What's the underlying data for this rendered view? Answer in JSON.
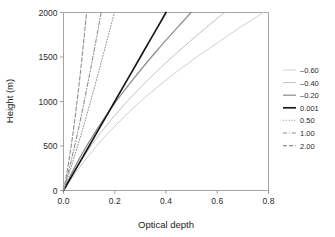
{
  "chart_data": {
    "type": "line",
    "title": "",
    "xlabel": "Optical depth",
    "ylabel": "Height (m)",
    "xlim": [
      0.0,
      0.8
    ],
    "ylim": [
      0,
      2000
    ],
    "xticks": [
      "0.0",
      "0.2",
      "0.4",
      "0.6",
      "0.8"
    ],
    "xtick_values": [
      0.0,
      0.2,
      0.4,
      0.6,
      0.8
    ],
    "yticks": [
      "0",
      "500",
      "1000",
      "1500",
      "2000"
    ],
    "ytick_values": [
      0,
      500,
      1000,
      1500,
      2000
    ],
    "grid": false,
    "legend_position": "right-outside",
    "legend_title": "",
    "series": [
      {
        "name": "-0.60",
        "label": "–0.60",
        "color": "#d0d0d0",
        "style": "solid",
        "width": 1.0,
        "x": [
          0.0,
          0.039,
          0.082,
          0.129,
          0.181,
          0.238,
          0.3,
          0.368,
          0.441,
          0.52,
          0.604,
          0.689,
          0.78
        ],
        "y": [
          0,
          167,
          333,
          500,
          667,
          833,
          1000,
          1167,
          1333,
          1500,
          1667,
          1833,
          2000
        ]
      },
      {
        "name": "-0.40",
        "label": "–0.40",
        "color": "#c2c2c2",
        "style": "solid",
        "width": 1.0,
        "x": [
          0.0,
          0.032,
          0.068,
          0.107,
          0.15,
          0.197,
          0.248,
          0.303,
          0.362,
          0.424,
          0.49,
          0.558,
          0.628
        ],
        "y": [
          0,
          167,
          333,
          500,
          667,
          833,
          1000,
          1167,
          1333,
          1500,
          1667,
          1833,
          2000
        ]
      },
      {
        "name": "-0.20",
        "label": "–0.20",
        "color": "#8a8a8a",
        "style": "solid",
        "width": 1.2,
        "x": [
          0.0,
          0.027,
          0.057,
          0.09,
          0.126,
          0.164,
          0.205,
          0.249,
          0.295,
          0.343,
          0.393,
          0.445,
          0.498
        ],
        "y": [
          0,
          167,
          333,
          500,
          667,
          833,
          1000,
          1167,
          1333,
          1500,
          1667,
          1833,
          2000
        ]
      },
      {
        "name": "0.001",
        "label": "0.001",
        "color": "#1a1a1a",
        "style": "solid",
        "width": 1.7,
        "x": [
          0.0,
          0.0333,
          0.0667,
          0.1,
          0.1333,
          0.1667,
          0.2,
          0.2333,
          0.2667,
          0.3,
          0.3333,
          0.3667,
          0.4
        ],
        "y": [
          0,
          167,
          333,
          500,
          667,
          833,
          1000,
          1167,
          1333,
          1500,
          1667,
          1833,
          2000
        ]
      },
      {
        "name": "0.50",
        "label": "0.50",
        "color": "#9a9a9a",
        "style": "dotted",
        "width": 1.1,
        "x": [
          0.0,
          0.019,
          0.0375,
          0.0553,
          0.0725,
          0.0892,
          0.1055,
          0.1215,
          0.1372,
          0.1527,
          0.168,
          0.1833,
          0.1985
        ],
        "y": [
          0,
          167,
          333,
          500,
          667,
          833,
          1000,
          1167,
          1333,
          1500,
          1667,
          1833,
          2000
        ]
      },
      {
        "name": "1.00",
        "label": "1.00",
        "color": "#8f8f8f",
        "style": "dashdot",
        "width": 1.1,
        "x": [
          0.0,
          0.0155,
          0.03,
          0.0436,
          0.0565,
          0.0689,
          0.0809,
          0.0925,
          0.1038,
          0.1148,
          0.1257,
          0.1363,
          0.1468
        ],
        "y": [
          0,
          167,
          333,
          500,
          667,
          833,
          1000,
          1167,
          1333,
          1500,
          1667,
          1833,
          2000
        ]
      },
      {
        "name": "2.00",
        "label": "2.00",
        "color": "#8f8f8f",
        "style": "dashed",
        "width": 1.1,
        "x": [
          0.0,
          0.0112,
          0.0211,
          0.03,
          0.0382,
          0.0458,
          0.053,
          0.0598,
          0.0663,
          0.0725,
          0.0785,
          0.0843,
          0.09
        ],
        "y": [
          0,
          167,
          333,
          500,
          667,
          833,
          1000,
          1167,
          1333,
          1500,
          1667,
          1833,
          2000
        ]
      }
    ]
  },
  "figure": {
    "background": "#ffffff",
    "axis_color": "#9a9a9a",
    "text_color": "#1a1a1a"
  }
}
